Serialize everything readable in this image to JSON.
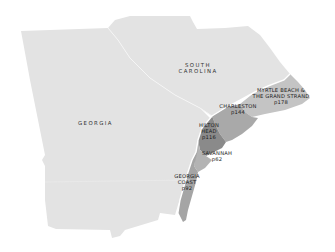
{
  "map": {
    "states": [
      {
        "id": "georgia",
        "label": "GEORGIA"
      },
      {
        "id": "south-carolina",
        "label_line1": "SOUTH",
        "label_line2": "CAROLINA"
      }
    ],
    "regions": [
      {
        "id": "myrtle-beach",
        "line1": "MYRTLE BEACH &",
        "line2": "THE GRAND STRAND",
        "page": "p178"
      },
      {
        "id": "charleston",
        "line1": "CHARLESTON",
        "page": "p144"
      },
      {
        "id": "hilton-head",
        "line1": "HILTON",
        "line2": "HEAD",
        "page": "p116"
      },
      {
        "id": "savannah",
        "line1": "SAVANNAH",
        "page": "p62"
      },
      {
        "id": "georgia-coast",
        "line1": "GEORGIA",
        "line2": "COAST",
        "page": "p92"
      }
    ],
    "colors": {
      "land": "#e3e3e3",
      "border": "#f4f4f4",
      "myrtle": "#c4c4c4",
      "charleston": "#a9a9a9",
      "hilton": "#8a8a8a",
      "savannah": "#b3b3b3",
      "coast": "#a5a5a5"
    }
  }
}
